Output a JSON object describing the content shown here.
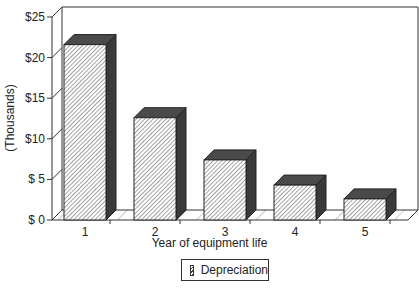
{
  "chart_data": {
    "type": "bar",
    "style": "3d-hatched",
    "title": "",
    "xlabel": "Year of equipment life",
    "ylabel": "(Thousands)",
    "categories": [
      "1",
      "2",
      "3",
      "4",
      "5"
    ],
    "series": [
      {
        "name": "Depreciation",
        "values": [
          21.6,
          12.6,
          7.4,
          4.3,
          2.6
        ]
      }
    ],
    "yticks": [
      "$ 0",
      "$ 5",
      "$10",
      "$15",
      "$20",
      "$25"
    ],
    "ylim": [
      0,
      25
    ],
    "grid": false,
    "legend_position": "bottom-center"
  },
  "legend": {
    "label": "Depreciation"
  },
  "colors": {
    "bar_top": "#444444",
    "bar_side": "#333333",
    "bar_hatch": "#444444",
    "frame": "#333333"
  }
}
